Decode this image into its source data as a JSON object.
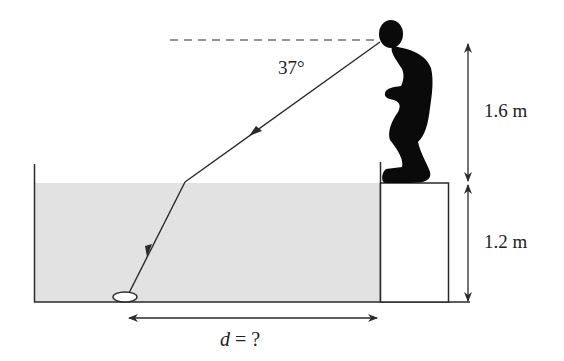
{
  "diagram": {
    "angle_label": "37°",
    "height_person_label": "1.6 m",
    "height_box_label": "1.2 m",
    "distance_label_var": "d",
    "distance_label_rest": " = ?",
    "colors": {
      "water": "#e2e2e2",
      "line": "#2a2a2a",
      "silhouette": "#0a0a0a"
    }
  }
}
